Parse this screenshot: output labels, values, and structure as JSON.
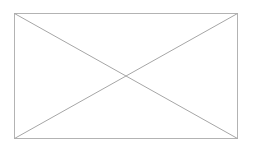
{
  "page": {
    "background_color": "#ffffff",
    "width": 253,
    "height": 148
  },
  "placeholder": {
    "kind": "broken-image-placeholder",
    "alt_text": "",
    "frame": {
      "x": 14,
      "y": 13,
      "width": 224,
      "height": 126,
      "border_color": "#b3b3b3",
      "border_width": 1,
      "fill_color": "#ffffff"
    },
    "diagonals": {
      "color": "#a6a6a6",
      "width": 1,
      "lines": [
        {
          "name": "diagonal-top-left-to-bottom-right",
          "x1": 0,
          "y1": 0,
          "x2": 224,
          "y2": 126
        },
        {
          "name": "diagonal-bottom-left-to-top-right",
          "x1": 0,
          "y1": 126,
          "x2": 224,
          "y2": 0
        }
      ],
      "intersection": {
        "x": 112,
        "y": 63
      }
    }
  }
}
